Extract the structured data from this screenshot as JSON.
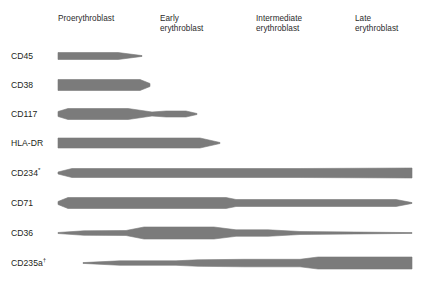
{
  "figure": {
    "band_color": "#7b7b7b",
    "background_color": "#ffffff",
    "text_color": "#231f20",
    "width": 423,
    "height": 291
  },
  "stages": [
    {
      "name": "proerythroblast",
      "label": "Proerythroblast",
      "x": 58,
      "y": 14
    },
    {
      "name": "early-erythroblast",
      "label": "Early\nerythroblast",
      "x": 160,
      "y": 14
    },
    {
      "name": "intermediate-erythroblast",
      "label": "Intermediate\nerythroblast",
      "x": 256,
      "y": 14
    },
    {
      "name": "late-erythroblast",
      "label": "Late\nerythroblast",
      "x": 355,
      "y": 14
    }
  ],
  "markers": [
    {
      "name": "cd45",
      "label": "CD45",
      "sup": "",
      "y": 56
    },
    {
      "name": "cd38",
      "label": "CD38",
      "sup": "",
      "y": 85
    },
    {
      "name": "cd117",
      "label": "CD117",
      "sup": "",
      "y": 114
    },
    {
      "name": "hla-dr",
      "label": "HLA-DR",
      "sup": "",
      "y": 143
    },
    {
      "name": "cd234",
      "label": "CD234",
      "sup": "*",
      "y": 173
    },
    {
      "name": "cd71",
      "label": "CD71",
      "sup": "",
      "y": 203
    },
    {
      "name": "cd36",
      "label": "CD36",
      "sup": "",
      "y": 233
    },
    {
      "name": "cd235a",
      "label": "CD235a",
      "sup": "†",
      "y": 263
    }
  ],
  "chart_data": {
    "type": "area",
    "xlabel": "",
    "ylabel": "",
    "categories": [
      "Proerythroblast",
      "Early erythroblast",
      "Intermediate erythroblast",
      "Late erythroblast"
    ],
    "category_x_px": [
      58,
      160,
      256,
      355
    ],
    "x_axis_px": [
      58,
      412
    ],
    "legend": "none",
    "grid": false,
    "notes": [
      "Band thickness encodes relative expression level of each surface marker across erythroid maturation stages.",
      "CD234 is annotated with an asterisk (*).",
      "CD235a is annotated with a dagger (†)."
    ],
    "series": [
      {
        "name": "CD45",
        "label": "CD45",
        "y_center": 56,
        "x_start": 58,
        "x_end": 142,
        "expression": "high at proerythroblast, tapering to zero before early erythroblast",
        "profile": [
          {
            "x": 58,
            "thickness": 7.0
          },
          {
            "x": 118,
            "thickness": 7.0
          },
          {
            "x": 142,
            "thickness": 0.8
          }
        ]
      },
      {
        "name": "CD38",
        "label": "CD38",
        "y_center": 85,
        "x_start": 58,
        "x_end": 150,
        "expression": "high through proerythroblast, blunt rounded end at early erythroblast boundary",
        "profile": [
          {
            "x": 58,
            "thickness": 11.0
          },
          {
            "x": 140,
            "thickness": 11.0
          },
          {
            "x": 150,
            "thickness": 3.0
          }
        ]
      },
      {
        "name": "CD117",
        "label": "CD117",
        "y_center": 114,
        "x_start": 58,
        "x_end": 197,
        "expression": "high at proerythroblast, narrows mid-way, slight re-widening then tapers at early erythroblast",
        "profile": [
          {
            "x": 58,
            "thickness": 5.0
          },
          {
            "x": 68,
            "thickness": 11.0
          },
          {
            "x": 128,
            "thickness": 11.0
          },
          {
            "x": 152,
            "thickness": 4.0
          },
          {
            "x": 166,
            "thickness": 6.0
          },
          {
            "x": 186,
            "thickness": 6.0
          },
          {
            "x": 197,
            "thickness": 1.0
          }
        ]
      },
      {
        "name": "HLA-DR",
        "label": "HLA-DR",
        "y_center": 143,
        "x_start": 58,
        "x_end": 220,
        "expression": "uniformly high from proerythroblast through early erythroblast, tapering off",
        "profile": [
          {
            "x": 58,
            "thickness": 10.0
          },
          {
            "x": 200,
            "thickness": 10.0
          },
          {
            "x": 220,
            "thickness": 1.0
          }
        ]
      },
      {
        "name": "CD234",
        "label": "CD234*",
        "y_center": 173,
        "x_start": 58,
        "x_end": 412,
        "expression": "expressed at all stages, rounded onset, sustained to late erythroblast",
        "profile": [
          {
            "x": 58,
            "thickness": 2.0
          },
          {
            "x": 72,
            "thickness": 9.0
          },
          {
            "x": 300,
            "thickness": 9.0
          },
          {
            "x": 412,
            "thickness": 10.0
          }
        ]
      },
      {
        "name": "CD71",
        "label": "CD71",
        "y_center": 203,
        "x_start": 58,
        "x_end": 412,
        "expression": "very high early, step down at intermediate erythroblast, persists and tapers to a point at late erythroblast",
        "profile": [
          {
            "x": 58,
            "thickness": 3.0
          },
          {
            "x": 68,
            "thickness": 11.0
          },
          {
            "x": 226,
            "thickness": 11.0
          },
          {
            "x": 236,
            "thickness": 7.0
          },
          {
            "x": 396,
            "thickness": 7.0
          },
          {
            "x": 412,
            "thickness": 0.8
          }
        ]
      },
      {
        "name": "CD36",
        "label": "CD36",
        "y_center": 233,
        "x_start": 58,
        "x_end": 412,
        "expression": "low at proerythroblast, peaks across early erythroblast, declines through intermediate and fades at late erythroblast",
        "profile": [
          {
            "x": 58,
            "thickness": 1.0
          },
          {
            "x": 84,
            "thickness": 4.5
          },
          {
            "x": 126,
            "thickness": 5.0
          },
          {
            "x": 144,
            "thickness": 12.0
          },
          {
            "x": 214,
            "thickness": 12.0
          },
          {
            "x": 236,
            "thickness": 6.5
          },
          {
            "x": 268,
            "thickness": 6.5
          },
          {
            "x": 300,
            "thickness": 3.0
          },
          {
            "x": 412,
            "thickness": 0.8
          }
        ]
      },
      {
        "name": "CD235a",
        "label": "CD235a†",
        "y_center": 263,
        "x_start": 83,
        "x_end": 412,
        "expression": "absent at proerythroblast, emerges in early erythroblast and increases steadily to maximum at late erythroblast",
        "profile": [
          {
            "x": 83,
            "thickness": 0.8
          },
          {
            "x": 120,
            "thickness": 4.5
          },
          {
            "x": 176,
            "thickness": 4.5
          },
          {
            "x": 198,
            "thickness": 6.5
          },
          {
            "x": 244,
            "thickness": 7.5
          },
          {
            "x": 300,
            "thickness": 7.5
          },
          {
            "x": 318,
            "thickness": 12.0
          },
          {
            "x": 412,
            "thickness": 12.0
          }
        ]
      }
    ]
  }
}
